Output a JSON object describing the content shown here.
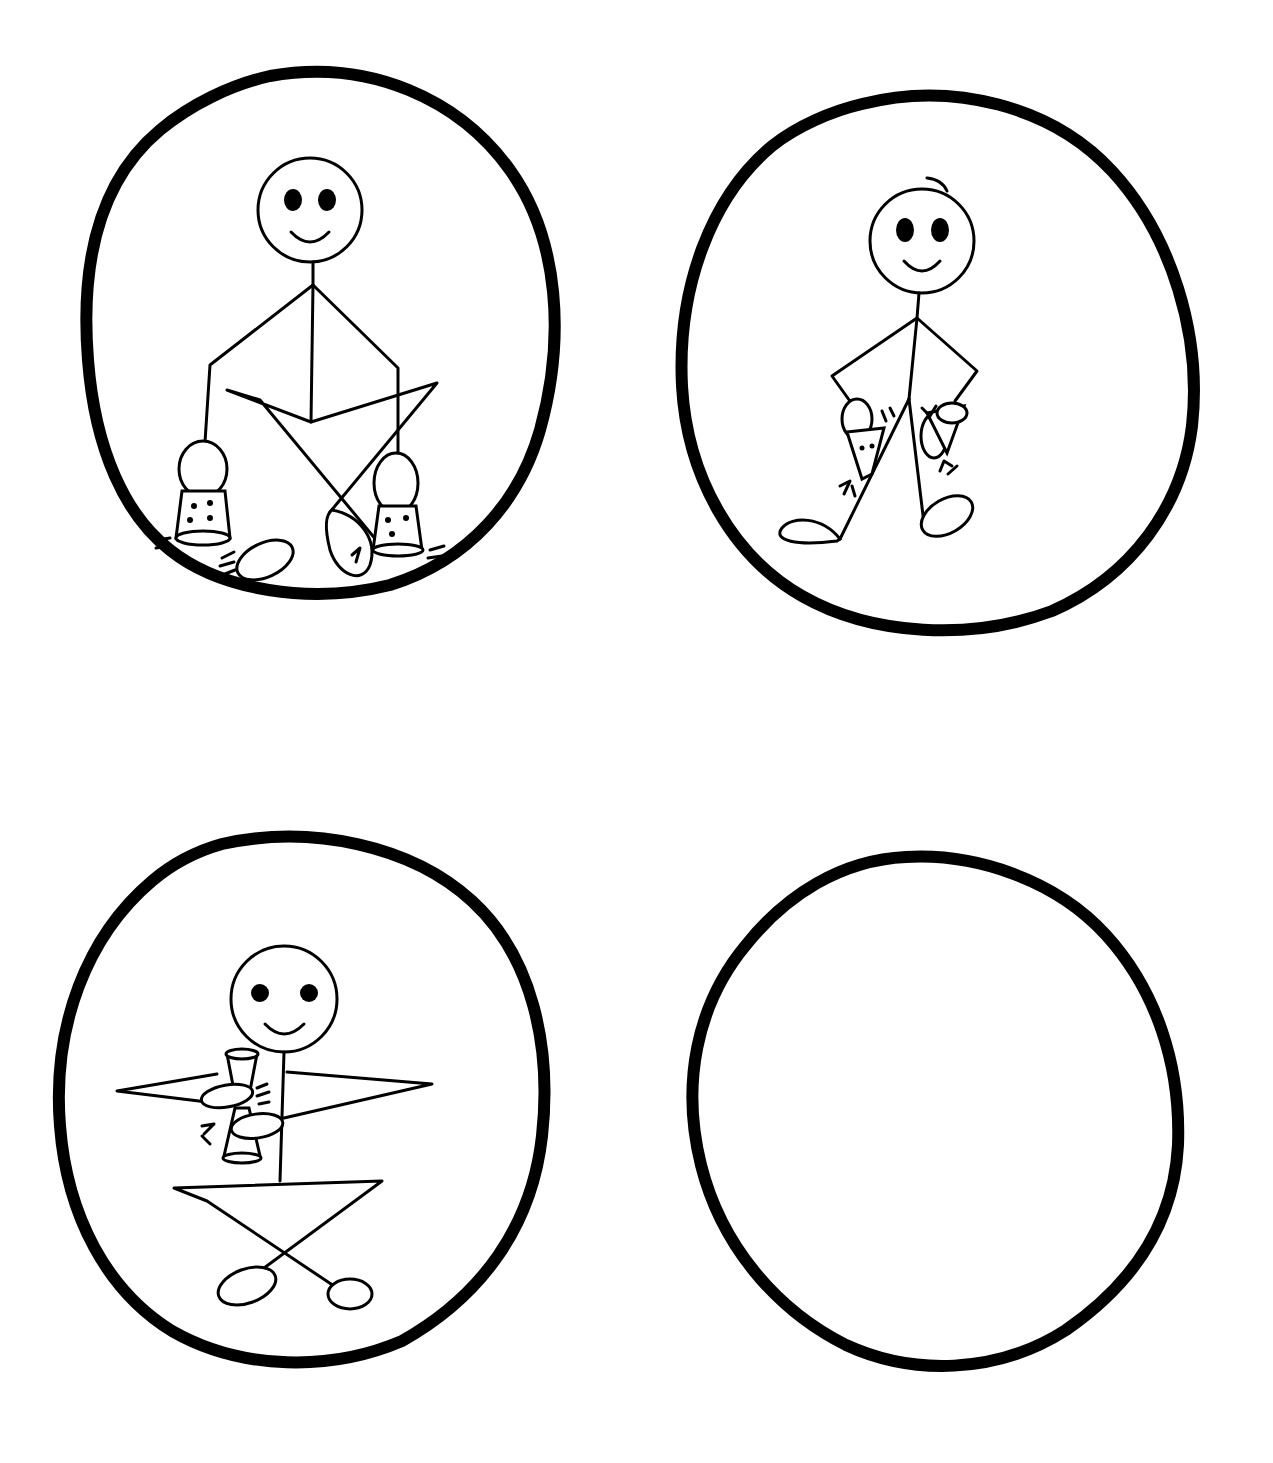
{
  "illustration": {
    "layout": "2x2 grid of hand-drawn circles",
    "panels": [
      {
        "id": "panel-1",
        "description": "Smiling stick figure sitting cross-legged, holding a dotted shaker in each hand resting on the floor, with motion marks",
        "pose": "seated-cross-legged",
        "props": [
          "shaker-left",
          "shaker-right"
        ],
        "motion_marks": true
      },
      {
        "id": "panel-2",
        "description": "Smiling stick figure standing, hands on hips holding shakers against thighs, with motion marks",
        "pose": "standing",
        "props": [
          "shaker-left",
          "shaker-right"
        ],
        "motion_marks": true
      },
      {
        "id": "panel-3",
        "description": "Smiling stick figure sitting cross-legged, holding a shaker in front of chest with both hands, with motion marks",
        "pose": "seated-cross-legged",
        "props": [
          "shaker-center"
        ],
        "motion_marks": true
      },
      {
        "id": "panel-4",
        "description": "Empty circle",
        "pose": "none",
        "props": [],
        "motion_marks": false
      }
    ],
    "colors": {
      "ink": "#000000",
      "paper": "#ffffff"
    }
  }
}
